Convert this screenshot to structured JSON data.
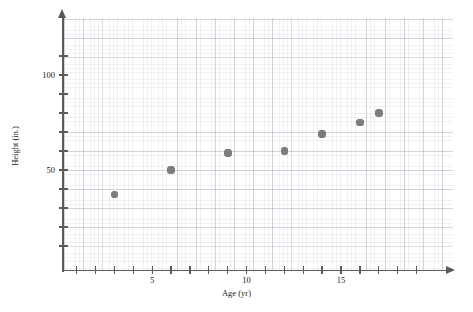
{
  "chart_data": {
    "type": "scatter",
    "title": "",
    "xlabel": "Age (yr)",
    "ylabel": "Height (in.)",
    "xlim": [
      0,
      20.5
    ],
    "ylim": [
      0,
      130
    ],
    "grid": true,
    "legend": null,
    "x": [
      3,
      6,
      9,
      12,
      14,
      16,
      17
    ],
    "y": [
      37,
      50,
      59,
      60,
      69,
      75,
      80
    ],
    "points": [
      {
        "age": 3,
        "height": 37
      },
      {
        "age": 6,
        "height": 50
      },
      {
        "age": 9,
        "height": 59
      },
      {
        "age": 12,
        "height": 60
      },
      {
        "age": 14,
        "height": 69
      },
      {
        "age": 16,
        "height": 75
      },
      {
        "age": 17,
        "height": 80
      }
    ],
    "x_ticks": [
      1,
      2,
      3,
      4,
      5,
      6,
      7,
      8,
      9,
      10,
      11,
      12,
      13,
      14,
      15,
      16,
      17,
      18,
      19
    ],
    "x_tick_labels": [
      {
        "value": 5,
        "label": "5"
      },
      {
        "value": 10,
        "label": "10"
      },
      {
        "value": 15,
        "label": "15"
      }
    ],
    "y_ticks": [
      10,
      20,
      30,
      40,
      50,
      60,
      70,
      80,
      90,
      100,
      110
    ],
    "y_tick_labels": [
      {
        "value": 50,
        "label": "50"
      },
      {
        "value": 100,
        "label": "100"
      }
    ],
    "marker_color": "#7d7d7d",
    "axis_color": "#5a5a5a",
    "grid_color": "#c8cedb"
  }
}
